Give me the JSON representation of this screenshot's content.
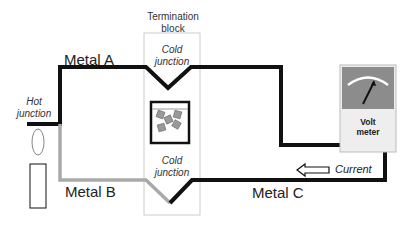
{
  "diagram": {
    "type": "thermocouple-circuit",
    "labels": {
      "termination_block": "Termination\nblock",
      "termination_block_line1": "Termination",
      "termination_block_line2": "block",
      "cold_junction_top_line1": "Cold",
      "cold_junction_top_line2": "junction",
      "cold_junction_bottom_line1": "Cold",
      "cold_junction_bottom_line2": "junction",
      "hot_junction_line1": "Hot",
      "hot_junction_line2": "junction",
      "metal_a": "Metal A",
      "metal_b": "Metal B",
      "metal_c": "Metal C",
      "current": "Current",
      "voltmeter_line1": "Volt",
      "voltmeter_line2": "meter"
    },
    "components": [
      {
        "id": "heat-source",
        "kind": "candle"
      },
      {
        "id": "ice-bath",
        "kind": "ice-cubes-in-container"
      },
      {
        "id": "voltmeter",
        "kind": "analog-meter"
      },
      {
        "id": "current-arrow",
        "direction": "left"
      }
    ],
    "colors": {
      "metal_a": "#111111",
      "metal_b": "#a9a9a9",
      "metal_c": "#111111",
      "block_border": "#cccccc",
      "meter_face": "#8c8c8c",
      "meter_body": "#eeeeee",
      "ice": "#9a9a9a"
    }
  }
}
